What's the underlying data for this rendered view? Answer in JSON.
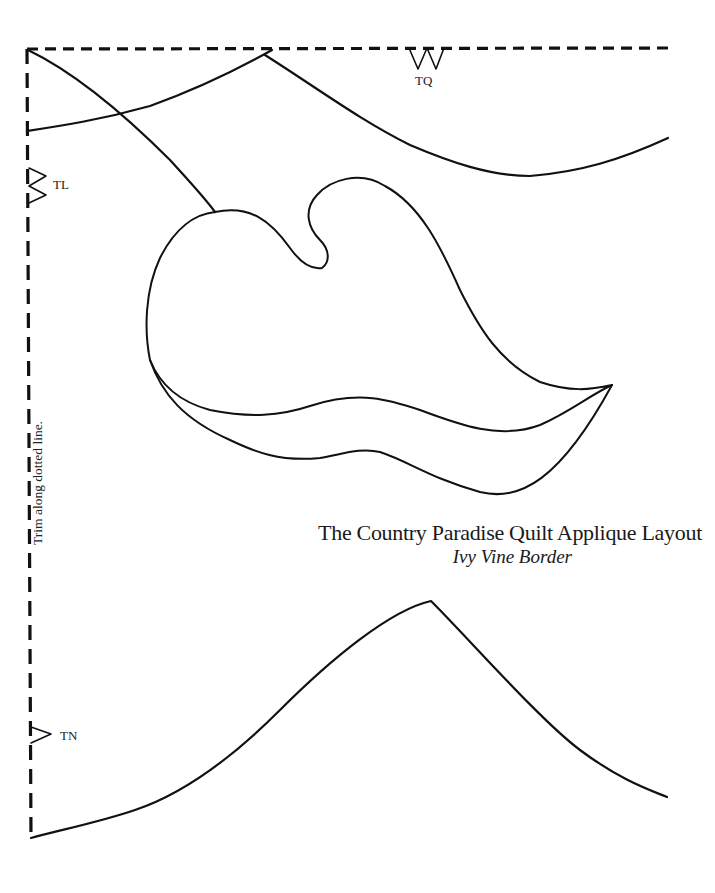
{
  "document": {
    "title": "The Country Paradise Quilt Applique Layout",
    "subtitle": "Ivy Vine Border",
    "trim_instruction": "Trim along dotted line."
  },
  "registration_marks": [
    {
      "label": "TQ",
      "position": "top-edge"
    },
    {
      "label": "TL",
      "position": "left-edge-upper"
    },
    {
      "label": "TN",
      "position": "left-edge-lower"
    }
  ],
  "colors": {
    "line": "#111111",
    "background": "#ffffff"
  }
}
